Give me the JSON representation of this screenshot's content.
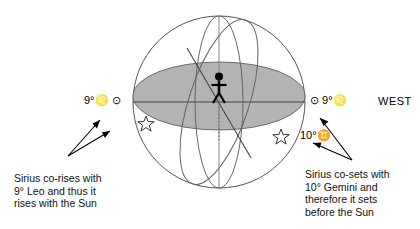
{
  "diagram": {
    "colors": {
      "horizon_fill": "#b3b3b3",
      "sphere_stroke": "#555555",
      "line_stroke": "#444444",
      "figure_fill": "#000000",
      "text": "#111111"
    },
    "observer": {
      "name": "observer-figure"
    },
    "horizon_label": "horizon-plane"
  },
  "labels": {
    "east_sun": "9°♌ ⊙",
    "west_sun": "⊙ 9°♌",
    "gemini": "10°♊",
    "west_direction": "WEST"
  },
  "icons": {
    "sun_symbol": "sun-icon",
    "leo_symbol": "leo-zodiac-icon",
    "gemini_symbol": "gemini-zodiac-icon",
    "star_left": "sirius-star-rising-icon",
    "star_right": "sirius-star-setting-icon"
  },
  "captions": {
    "left": "Sirius co-rises with\n9° Leo and thus it\nrises with the Sun",
    "right": "Sirius co-sets with\n10° Gemini and\ntherefore it sets\nbefore the Sun"
  }
}
